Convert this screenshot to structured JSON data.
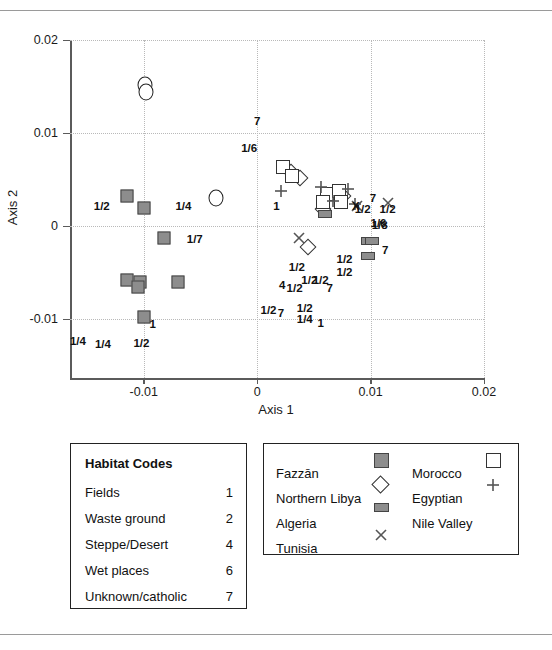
{
  "chart_data": {
    "type": "scatter",
    "title": "",
    "xlabel": "Axis 1",
    "ylabel": "Axis 2",
    "xlim": [
      -0.0165,
      0.02
    ],
    "ylim": [
      -0.0163,
      0.02
    ],
    "xticks": [
      -0.01,
      0,
      0.01,
      0.02
    ],
    "xticklabels": [
      "-0.01",
      "0",
      "0.01",
      "0.02"
    ],
    "yticks": [
      -0.01,
      0,
      0.01,
      0.02
    ],
    "yticklabels": [
      "-0.01",
      "0",
      "0.01",
      "0.02"
    ],
    "grid": "dotted-both",
    "legend_position": "below-plot",
    "series": [
      {
        "name": "Fazzan",
        "marker": "filled-square",
        "color": "#8d8d8d",
        "points": [
          {
            "x": -0.0115,
            "y": 0.0032
          },
          {
            "x": -0.01,
            "y": 0.002
          },
          {
            "x": -0.0082,
            "y": -0.0013
          },
          {
            "x": -0.0115,
            "y": -0.0058
          },
          {
            "x": -0.0103,
            "y": -0.006
          },
          {
            "x": -0.0105,
            "y": -0.0065
          },
          {
            "x": -0.007,
            "y": -0.006
          },
          {
            "x": -0.01,
            "y": -0.0098
          }
        ]
      },
      {
        "name": "Northern Libya",
        "marker": "open-diamond",
        "color": "#333333",
        "points": [
          {
            "x": 0.003,
            "y": 0.0058
          },
          {
            "x": 0.0038,
            "y": 0.0052
          },
          {
            "x": 0.0076,
            "y": 0.0032
          },
          {
            "x": 0.0058,
            "y": 0.0018
          },
          {
            "x": 0.0045,
            "y": -0.0022
          }
        ]
      },
      {
        "name": "Algeria",
        "marker": "filled-rect",
        "color": "#8d8d8d",
        "points": [
          {
            "x": 0.006,
            "y": 0.0013
          },
          {
            "x": 0.0098,
            "y": -0.0016
          },
          {
            "x": 0.0101,
            "y": -0.0016
          },
          {
            "x": 0.0098,
            "y": -0.0032
          }
        ]
      },
      {
        "name": "Tunisia",
        "marker": "x",
        "color": "#555555",
        "points": [
          {
            "x": 0.0037,
            "y": -0.0013
          },
          {
            "x": 0.0088,
            "y": 0.0022
          },
          {
            "x": 0.0115,
            "y": 0.0025
          }
        ]
      },
      {
        "name": "Morocco",
        "marker": "open-square",
        "color": "#333333",
        "points": [
          {
            "x": 0.0023,
            "y": 0.0064
          },
          {
            "x": 0.0031,
            "y": 0.0054
          },
          {
            "x": 0.0062,
            "y": 0.0035
          },
          {
            "x": 0.0072,
            "y": 0.0038
          },
          {
            "x": 0.0058,
            "y": 0.0026
          },
          {
            "x": 0.0074,
            "y": 0.0026
          }
        ]
      },
      {
        "name": "Egyptian",
        "marker": "plus",
        "color": "#555555",
        "points": [
          {
            "x": 0.0021,
            "y": 0.0038
          },
          {
            "x": 0.0056,
            "y": 0.0042
          },
          {
            "x": 0.008,
            "y": 0.004
          },
          {
            "x": 0.0067,
            "y": 0.0027
          },
          {
            "x": 0.0086,
            "y": 0.0024
          }
        ]
      },
      {
        "name": "Nile Valley",
        "marker": "open-circle",
        "color": "#222222",
        "points": [
          {
            "x": -0.0099,
            "y": 0.0152
          },
          {
            "x": -0.0098,
            "y": 0.0144
          },
          {
            "x": -0.0036,
            "y": 0.003
          }
        ]
      }
    ],
    "point_labels": [
      {
        "text": "7",
        "x": 0.0,
        "y": 0.0113
      },
      {
        "text": "1/6",
        "x": -0.0007,
        "y": 0.0084
      },
      {
        "text": "1/2",
        "x": -0.0137,
        "y": 0.0022
      },
      {
        "text": "1/4",
        "x": -0.0065,
        "y": 0.0022
      },
      {
        "text": "1/7",
        "x": -0.0055,
        "y": -0.0014
      },
      {
        "text": "1",
        "x": -0.0092,
        "y": -0.0105
      },
      {
        "text": "1/2",
        "x": -0.0102,
        "y": -0.0125
      },
      {
        "text": "1/4",
        "x": -0.0158,
        "y": -0.0123
      },
      {
        "text": "1/4",
        "x": -0.0136,
        "y": -0.0126
      },
      {
        "text": "1",
        "x": 0.0017,
        "y": 0.0022
      },
      {
        "text": "1/2",
        "x": 0.0035,
        "y": -0.0044
      },
      {
        "text": "1/2",
        "x": 0.0046,
        "y": -0.0058
      },
      {
        "text": "4",
        "x": 0.0022,
        "y": -0.0063
      },
      {
        "text": "1/2",
        "x": 0.0033,
        "y": -0.0066
      },
      {
        "text": "1/2",
        "x": 0.0056,
        "y": -0.0058
      },
      {
        "text": "7",
        "x": 0.0064,
        "y": -0.0066
      },
      {
        "text": "1/2",
        "x": 0.001,
        "y": -0.009
      },
      {
        "text": "7",
        "x": 0.0021,
        "y": -0.0093
      },
      {
        "text": "1/2",
        "x": 0.0042,
        "y": -0.0088
      },
      {
        "text": "1/4",
        "x": 0.0042,
        "y": -0.01
      },
      {
        "text": "1",
        "x": 0.0056,
        "y": -0.0104
      },
      {
        "text": "1/2",
        "x": 0.0077,
        "y": -0.0035
      },
      {
        "text": "1/2",
        "x": 0.0077,
        "y": -0.0049
      },
      {
        "text": "X",
        "x": 0.0087,
        "y": 0.0022
      },
      {
        "text": "1/2",
        "x": 0.0093,
        "y": 0.0019
      },
      {
        "text": "7",
        "x": 0.0102,
        "y": 0.003
      },
      {
        "text": "1/2",
        "x": 0.0115,
        "y": 0.0019
      },
      {
        "text": "1/6",
        "x": 0.0107,
        "y": 0.0003
      },
      {
        "text": "1/8",
        "x": 0.0108,
        "y": 0.0001
      },
      {
        "text": "7",
        "x": 0.0113,
        "y": -0.0026
      }
    ]
  },
  "habitat_legend": {
    "title": "Habitat Codes",
    "rows": [
      {
        "name": "Fields",
        "code": "1"
      },
      {
        "name": "Waste ground",
        "code": "2"
      },
      {
        "name": "Steppe/Desert",
        "code": "4"
      },
      {
        "name": "Wet places",
        "code": "6"
      },
      {
        "name": "Unknown/catholic",
        "code": "7"
      }
    ]
  },
  "group_legend": {
    "left_column": [
      "Fazzān",
      "Northern Libya",
      "Algeria",
      "Tunisia"
    ],
    "right_column": [
      "Morocco",
      "Egyptian",
      "Nile Valley"
    ]
  }
}
